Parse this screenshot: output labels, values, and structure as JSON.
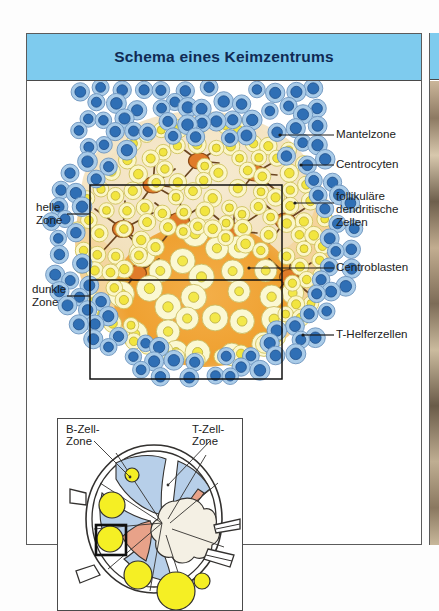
{
  "figure": {
    "title": "Schema eines Keimzentrums",
    "title_bg": "#7ecbee",
    "title_color": "#102a54"
  },
  "labels_right": [
    {
      "name": "mantelzone",
      "text": "Mantelzone"
    },
    {
      "name": "centrocyten",
      "text": "Centrocyten"
    },
    {
      "name": "fdc-line1",
      "text": "follikuläre"
    },
    {
      "name": "fdc-line2",
      "text": "dendritische"
    },
    {
      "name": "fdc-line3",
      "text": "Zellen"
    },
    {
      "name": "centroblasten",
      "text": "Centroblasten"
    },
    {
      "name": "t-helferzellen",
      "text": "T-Helferzellen"
    }
  ],
  "labels_left": [
    {
      "name": "helle-zone-line1",
      "text": "helle"
    },
    {
      "name": "helle-zone-line2",
      "text": "Zone"
    },
    {
      "name": "dunkle-zone-line1",
      "text": "dunkle"
    },
    {
      "name": "dunkle-zone-line2",
      "text": "Zone"
    }
  ],
  "inset": {
    "b_zone_line1": "B-Zell-",
    "b_zone_line2": "Zone",
    "t_zone_line1": "T-Zell-",
    "t_zone_line2": "Zone"
  },
  "colors": {
    "mantle_cell_ring": "#a9cbe8",
    "mantle_cell_nucleus": "#2f6fb5",
    "centrocyte_ring": "#fbf6c8",
    "centrocyte_nucleus": "#f2e53f",
    "centroblast_ring": "#fbf8d2",
    "centroblast_nucleus": "#f3e84a",
    "dendritic_body": "#e07b2a",
    "dendritic_process": "#6b4520",
    "light_zone_bg": "#f0e2c4",
    "dark_zone_bg": "#f0a63a",
    "halo": "#f6d79a",
    "inset_b_zone": "#b7cfe9",
    "inset_medulla": "#e8a289",
    "inset_follicle": "#f5ef24",
    "inset_hilum": "#f4f0e4",
    "leader_line": "#1b1b1b"
  }
}
